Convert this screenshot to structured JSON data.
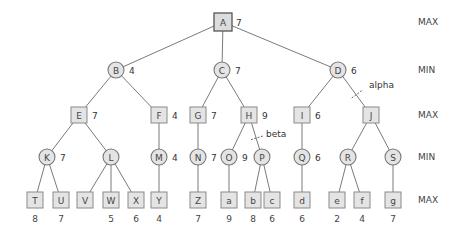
{
  "levels": [
    {
      "label": "MAX",
      "y": 22
    },
    {
      "label": "MIN",
      "y": 70
    },
    {
      "label": "MAX",
      "y": 115
    },
    {
      "label": "MIN",
      "y": 157
    },
    {
      "label": "MAX",
      "y": 200
    }
  ],
  "nodes": [
    {
      "id": "A",
      "shape": "square",
      "x": 223,
      "y": 22,
      "value": "7",
      "root": true
    },
    {
      "id": "B",
      "shape": "circle",
      "x": 116,
      "y": 70,
      "value": "4"
    },
    {
      "id": "C",
      "shape": "circle",
      "x": 222,
      "y": 70,
      "value": "7"
    },
    {
      "id": "D",
      "shape": "circle",
      "x": 338,
      "y": 70,
      "value": "6"
    },
    {
      "id": "E",
      "shape": "square",
      "x": 79,
      "y": 115,
      "value": "7"
    },
    {
      "id": "F",
      "shape": "square",
      "x": 159,
      "y": 115,
      "value": "4"
    },
    {
      "id": "G",
      "shape": "square",
      "x": 198,
      "y": 115,
      "value": "7"
    },
    {
      "id": "H",
      "shape": "square",
      "x": 249,
      "y": 115,
      "value": "9"
    },
    {
      "id": "I",
      "shape": "square",
      "x": 302,
      "y": 115,
      "value": "6"
    },
    {
      "id": "J",
      "shape": "square",
      "x": 371,
      "y": 115,
      "value": ""
    },
    {
      "id": "K",
      "shape": "circle",
      "x": 47,
      "y": 157,
      "value": "7"
    },
    {
      "id": "L",
      "shape": "circle",
      "x": 111,
      "y": 157,
      "value": ""
    },
    {
      "id": "M",
      "shape": "circle",
      "x": 159,
      "y": 157,
      "value": "4"
    },
    {
      "id": "N",
      "shape": "circle",
      "x": 198,
      "y": 157,
      "value": "7"
    },
    {
      "id": "O",
      "shape": "circle",
      "x": 229,
      "y": 157,
      "value": "9"
    },
    {
      "id": "P",
      "shape": "circle",
      "x": 262,
      "y": 157,
      "value": ""
    },
    {
      "id": "Q",
      "shape": "circle",
      "x": 302,
      "y": 157,
      "value": "6"
    },
    {
      "id": "R",
      "shape": "circle",
      "x": 348,
      "y": 157,
      "value": ""
    },
    {
      "id": "S",
      "shape": "circle",
      "x": 393,
      "y": 157,
      "value": ""
    },
    {
      "id": "T",
      "shape": "square",
      "x": 35,
      "y": 200,
      "leafValue": "8"
    },
    {
      "id": "U",
      "shape": "square",
      "x": 61,
      "y": 200,
      "leafValue": "7"
    },
    {
      "id": "V",
      "shape": "square",
      "x": 85,
      "y": 200,
      "leafValue": ""
    },
    {
      "id": "W",
      "shape": "square",
      "x": 111,
      "y": 200,
      "leafValue": "5"
    },
    {
      "id": "X",
      "shape": "square",
      "x": 136,
      "y": 200,
      "leafValue": "6"
    },
    {
      "id": "Y",
      "shape": "square",
      "x": 159,
      "y": 200,
      "leafValue": "4"
    },
    {
      "id": "Z",
      "shape": "square",
      "x": 198,
      "y": 200,
      "leafValue": "7"
    },
    {
      "id": "a",
      "shape": "square",
      "x": 229,
      "y": 200,
      "leafValue": "9"
    },
    {
      "id": "b",
      "shape": "square",
      "x": 253,
      "y": 200,
      "leafValue": "8"
    },
    {
      "id": "c",
      "shape": "square",
      "x": 272,
      "y": 200,
      "leafValue": "6"
    },
    {
      "id": "d",
      "shape": "square",
      "x": 302,
      "y": 200,
      "leafValue": "6"
    },
    {
      "id": "e",
      "shape": "square",
      "x": 337,
      "y": 200,
      "leafValue": "2"
    },
    {
      "id": "f",
      "shape": "square",
      "x": 362,
      "y": 200,
      "leafValue": "4"
    },
    {
      "id": "g",
      "shape": "square",
      "x": 393,
      "y": 200,
      "leafValue": "7"
    }
  ],
  "edges": [
    [
      "A",
      "B"
    ],
    [
      "A",
      "C"
    ],
    [
      "A",
      "D"
    ],
    [
      "B",
      "E"
    ],
    [
      "B",
      "F"
    ],
    [
      "C",
      "G"
    ],
    [
      "C",
      "H"
    ],
    [
      "D",
      "I"
    ],
    [
      "D",
      "J"
    ],
    [
      "E",
      "K"
    ],
    [
      "E",
      "L"
    ],
    [
      "F",
      "M"
    ],
    [
      "G",
      "N"
    ],
    [
      "H",
      "O"
    ],
    [
      "H",
      "P"
    ],
    [
      "I",
      "Q"
    ],
    [
      "J",
      "R"
    ],
    [
      "J",
      "S"
    ],
    [
      "K",
      "T"
    ],
    [
      "K",
      "U"
    ],
    [
      "L",
      "V"
    ],
    [
      "L",
      "W"
    ],
    [
      "L",
      "X"
    ],
    [
      "M",
      "Y"
    ],
    [
      "N",
      "Z"
    ],
    [
      "O",
      "a"
    ],
    [
      "P",
      "b"
    ],
    [
      "P",
      "c"
    ],
    [
      "Q",
      "d"
    ],
    [
      "R",
      "e"
    ],
    [
      "R",
      "f"
    ],
    [
      "S",
      "g"
    ]
  ],
  "cuts": [
    {
      "label": "alpha",
      "edge": [
        "D",
        "J"
      ],
      "labelX": 369,
      "labelY": 85
    },
    {
      "label": "beta",
      "edge": [
        "H",
        "P"
      ],
      "labelX": 266,
      "labelY": 134
    }
  ]
}
